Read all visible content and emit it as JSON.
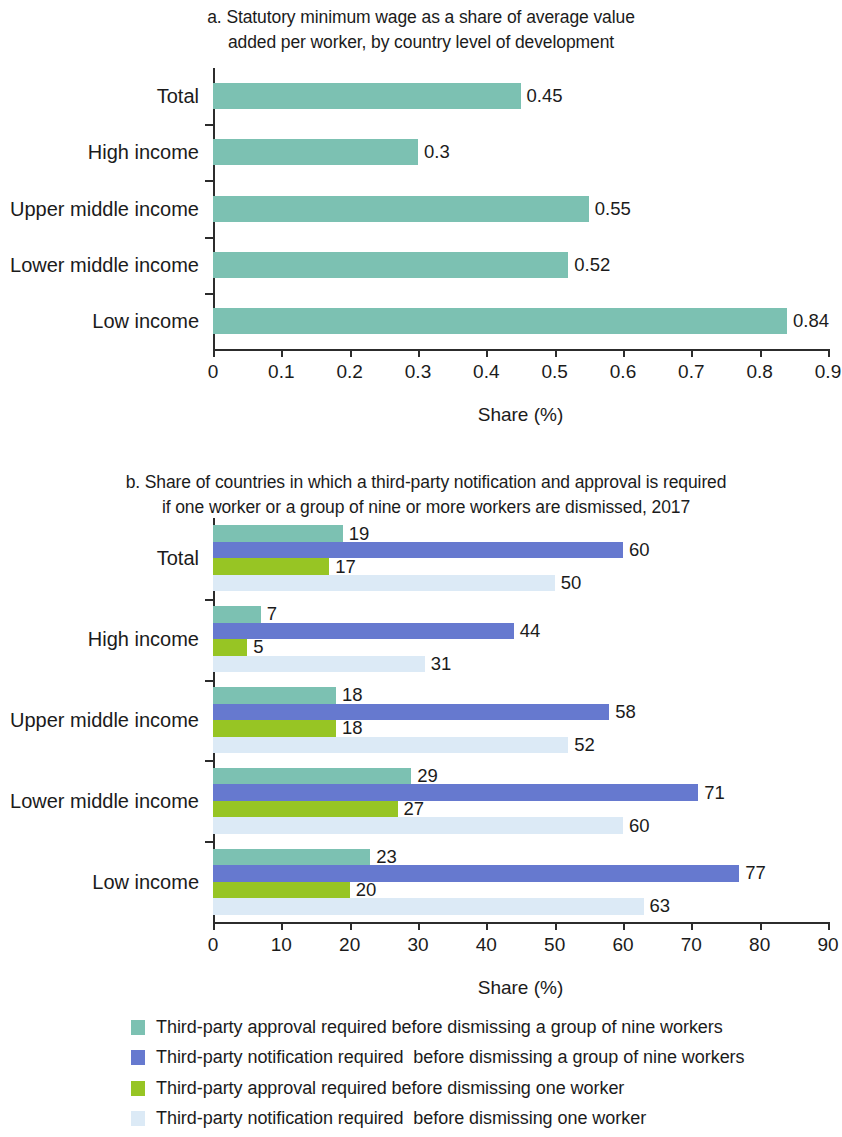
{
  "figure": {
    "panel_a": {
      "title": "a. Statutory minimum wage as a share of average value added per worker, by country level of development",
      "title_line1": "a. Statutory minimum wage as a share of average value",
      "title_line2": "added per worker, by country level of development",
      "axis_title": "Share (%)"
    },
    "panel_b": {
      "title": "b. Share of countries in which a third-party notification and approval is required if one worker or a group of nine or more workers are dismissed, 2017",
      "title_line1": "b. Share of countries in which a third-party notification and approval is required",
      "title_line2": "if one worker or a group of nine or more workers are dismissed, 2017",
      "axis_title": "Share (%)"
    }
  },
  "legend": {
    "items": [
      {
        "label": "Third-party approval required before dismissing a group of nine workers",
        "color": "#7cc1b2"
      },
      {
        "label": "Third-party notification required  before dismissing a group of nine workers",
        "color": "#6679cf"
      },
      {
        "label": "Third-party approval required before dismissing one worker",
        "color": "#97c524"
      },
      {
        "label": "Third-party notification required  before dismissing one worker",
        "color": "#dceaf6"
      }
    ]
  },
  "colors": {
    "teal": "#7cc1b2",
    "blue": "#6679cf",
    "green": "#97c524",
    "pale_blue": "#dceaf6",
    "axis": "#2c2c2c",
    "text": "#1b1b1b"
  },
  "chart_data": [
    {
      "type": "bar",
      "orientation": "horizontal",
      "panel": "a",
      "title": "a. Statutory minimum wage as a share of average value added per worker, by country level of development",
      "xlabel": "Share (%)",
      "ylabel": "",
      "categories": [
        "Total",
        "High income",
        "Upper middle income",
        "Lower middle income",
        "Low income"
      ],
      "values": [
        0.45,
        0.3,
        0.55,
        0.52,
        0.84
      ],
      "value_labels": [
        "0.45",
        "0.3",
        "0.55",
        "0.52",
        "0.84"
      ],
      "xlim": [
        0,
        0.9
      ],
      "xticks": [
        0,
        0.1,
        0.2,
        0.3,
        0.4,
        0.5,
        0.6,
        0.7,
        0.8,
        0.9
      ],
      "xtick_labels": [
        "0",
        "0.1",
        "0.2",
        "0.3",
        "0.4",
        "0.5",
        "0.6",
        "0.7",
        "0.8",
        "0.9"
      ],
      "grid": false,
      "legend_position": "none",
      "series": [
        {
          "name": "Statutory minimum wage share",
          "color": "#7cc1b2",
          "values": [
            0.45,
            0.3,
            0.55,
            0.52,
            0.84
          ]
        }
      ]
    },
    {
      "type": "bar",
      "orientation": "horizontal",
      "panel": "b",
      "title": "b. Share of countries in which a third-party notification and approval is required if one worker or a group of nine or more workers are dismissed, 2017",
      "xlabel": "Share (%)",
      "ylabel": "",
      "categories": [
        "Total",
        "High income",
        "Upper middle income",
        "Lower middle income",
        "Low income"
      ],
      "xlim": [
        0,
        90
      ],
      "xticks": [
        0,
        10,
        20,
        30,
        40,
        50,
        60,
        70,
        80,
        90
      ],
      "xtick_labels": [
        "0",
        "10",
        "20",
        "30",
        "40",
        "50",
        "60",
        "70",
        "80",
        "90"
      ],
      "grid": false,
      "legend_position": "below",
      "series": [
        {
          "name": "Third-party approval required before dismissing a group of nine workers",
          "color": "#7cc1b2",
          "values": [
            19,
            7,
            18,
            29,
            23
          ],
          "value_labels": [
            "19",
            "7",
            "18",
            "29",
            "23"
          ]
        },
        {
          "name": "Third-party notification required  before dismissing a group of nine workers",
          "color": "#6679cf",
          "values": [
            60,
            44,
            58,
            71,
            77
          ],
          "value_labels": [
            "60",
            "44",
            "58",
            "71",
            "77"
          ]
        },
        {
          "name": "Third-party approval required before dismissing one worker",
          "color": "#97c524",
          "values": [
            17,
            5,
            18,
            27,
            20
          ],
          "value_labels": [
            "17",
            "5",
            "18",
            "27",
            "20"
          ]
        },
        {
          "name": "Third-party notification required  before dismissing one worker",
          "color": "#dceaf6",
          "values": [
            50,
            31,
            52,
            60,
            63
          ],
          "value_labels": [
            "50",
            "31",
            "52",
            "60",
            "63"
          ]
        }
      ]
    }
  ]
}
